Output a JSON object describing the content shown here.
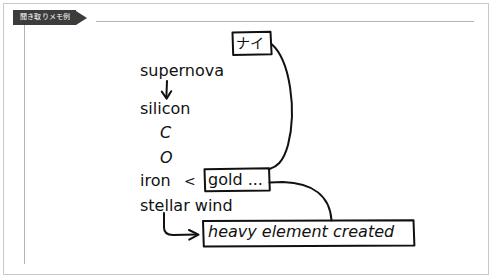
{
  "frame": {
    "tab": {
      "label": "聞き取りメモ例",
      "background_color": "#3c3c3c",
      "text_color": "#ffffff"
    },
    "rule_color": "#b3b3b3",
    "border_color": "#c9c9c9",
    "background_color": "#ffffff"
  },
  "diagram": {
    "ink_color": "#111111",
    "notes": [
      {
        "id": "supernova",
        "text": "supernova"
      },
      {
        "id": "silicon",
        "text": "silicon"
      },
      {
        "id": "carbon",
        "text": "C"
      },
      {
        "id": "oxygen",
        "text": "O"
      },
      {
        "id": "iron",
        "text": "iron"
      },
      {
        "id": "less-than",
        "text": "<"
      },
      {
        "id": "stellar-wind",
        "text": "stellar wind"
      }
    ],
    "boxes": [
      {
        "id": "nai",
        "text": "ナイ"
      },
      {
        "id": "gold",
        "text": "gold ..."
      },
      {
        "id": "heavy-element",
        "text": "heavy element created"
      }
    ],
    "connectors": [
      {
        "id": "supernova-to-silicon",
        "type": "arrow-down"
      },
      {
        "id": "nai-to-gold",
        "type": "curve"
      },
      {
        "id": "gold-to-heavy-element",
        "type": "curve"
      },
      {
        "id": "stellar-wind-to-heavy-element",
        "type": "elbow-arrow-right"
      }
    ]
  }
}
